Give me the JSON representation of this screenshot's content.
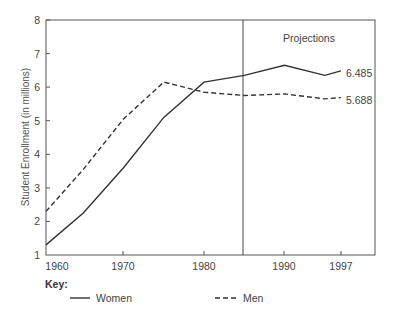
{
  "chart_data": {
    "type": "line",
    "title": "",
    "xlabel": "",
    "ylabel": "Student Enrollment (in millions)",
    "xlim": [
      1960,
      1999
    ],
    "ylim": [
      1,
      8
    ],
    "x_ticks": [
      1960,
      1970,
      1980,
      1990,
      1997
    ],
    "x_tick_labels": [
      "1960",
      "1970",
      "1980",
      "1990",
      "1997"
    ],
    "y_ticks": [
      1,
      2,
      3,
      4,
      5,
      6,
      7,
      8
    ],
    "y_tick_labels": [
      "1",
      "2",
      "3",
      "4",
      "5",
      "6",
      "7",
      "8"
    ],
    "grid": false,
    "x": [
      1960,
      1965,
      1970,
      1975,
      1980,
      1985,
      1990,
      1995,
      1997
    ],
    "series": [
      {
        "name": "Women",
        "style": "solid",
        "values": [
          1.3,
          2.25,
          3.6,
          5.1,
          6.15,
          6.35,
          6.65,
          6.35,
          6.485
        ],
        "end_label": "6.485"
      },
      {
        "name": "Men",
        "style": "dashed",
        "values": [
          2.3,
          3.55,
          5.05,
          6.15,
          5.85,
          5.75,
          5.8,
          5.65,
          5.688
        ],
        "end_label": "5.688"
      }
    ],
    "annotations": [
      {
        "type": "vertical_line",
        "x": 1985,
        "label": "Projections"
      }
    ],
    "legend": {
      "title": "Key:",
      "position": "bottom",
      "entries": [
        "Women",
        "Men"
      ]
    }
  },
  "labels": {
    "ylabel": "Student Enrollment (in millions)",
    "projections": "Projections",
    "women_end": "6.485",
    "men_end": "5.688",
    "key_title": "Key:",
    "legend_women": "Women",
    "legend_men": "Men",
    "x_ticks": [
      "1960",
      "1970",
      "1980",
      "1990",
      "1997"
    ],
    "y_ticks": [
      "1",
      "2",
      "3",
      "4",
      "5",
      "6",
      "7",
      "8"
    ]
  },
  "colors": {
    "line": "#333333",
    "axis": "#555555",
    "text": "#444444"
  }
}
